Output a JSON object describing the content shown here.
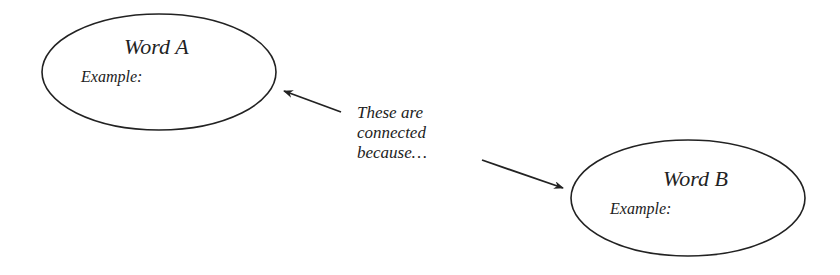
{
  "nodes": [
    {
      "id": "a",
      "title": "Word A",
      "example_label": "Example:"
    },
    {
      "id": "b",
      "title": "Word B",
      "example_label": "Example:"
    }
  ],
  "connector": {
    "lines": [
      "These are",
      "connected",
      "because…"
    ]
  },
  "colors": {
    "stroke": "#222222",
    "background": "#ffffff"
  }
}
